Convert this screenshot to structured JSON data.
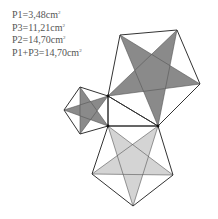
{
  "labels": [
    {
      "text": "P1=3,48cm",
      "sup": "2"
    },
    {
      "text": "P3=11,21cm",
      "sup": "2"
    },
    {
      "text": "P2=14,70cm",
      "sup": "2"
    },
    {
      "text": "P1+P3=14,70cm",
      "sup": "2"
    }
  ],
  "colors": {
    "stroke": "#333333",
    "dark_star": "#8a8a8a",
    "light_star": "#d4d4d4",
    "text": "#555555"
  },
  "figure": {
    "right_triangle": {
      "A": [
        108,
        96
      ],
      "B": [
        108,
        126
      ],
      "C": [
        158,
        126
      ]
    },
    "pentagons": [
      {
        "name": "small",
        "fill": "#8a8a8a",
        "vertices": [
          [
            108,
            96
          ],
          [
            80,
            87
          ],
          [
            64,
            110
          ],
          [
            80,
            134
          ],
          [
            108,
            126
          ]
        ]
      },
      {
        "name": "large",
        "fill": "#8a8a8a",
        "vertices": [
          [
            108,
            96
          ],
          [
            120,
            35
          ],
          [
            177,
            30
          ],
          [
            200,
            84
          ],
          [
            158,
            126
          ]
        ]
      },
      {
        "name": "bottom",
        "fill": "#d4d4d4",
        "vertices": [
          [
            108,
            126
          ],
          [
            158,
            126
          ],
          [
            173,
            175
          ],
          [
            133,
            206
          ],
          [
            92,
            174
          ]
        ]
      }
    ]
  }
}
